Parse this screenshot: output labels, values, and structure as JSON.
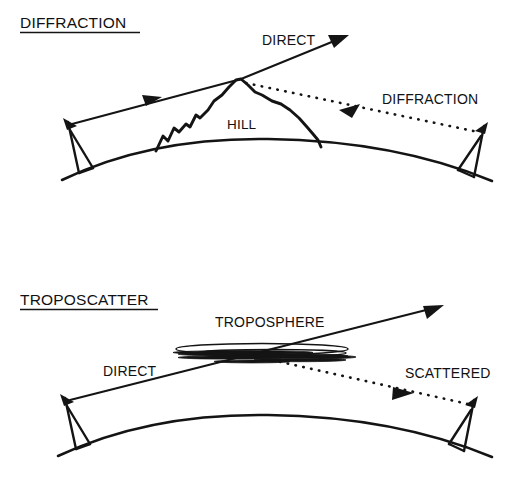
{
  "figure": {
    "background_color": "#ffffff",
    "ink_color": "#141414",
    "panels": [
      {
        "id": "diffraction",
        "title": "DIFFRACTION",
        "labels": {
          "direct": "DIRECT",
          "obstacle": "HILL",
          "diffracted": "DIFFRACTION"
        }
      },
      {
        "id": "troposcatter",
        "title": "TROPOSCATTER",
        "labels": {
          "direct": "DIRECT",
          "medium": "TROPOSPHERE",
          "scattered": "SCATTERED"
        }
      }
    ]
  }
}
